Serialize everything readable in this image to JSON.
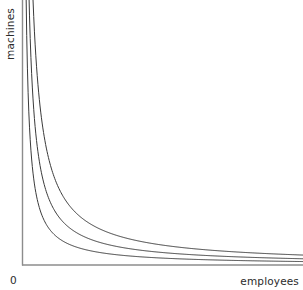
{
  "figure": {
    "kind": "isoquant-diagram",
    "background_color": "#ffffff"
  },
  "axes": {
    "origin_label": "0",
    "y_label": "machines",
    "x_label": "employees",
    "axis_color": "#8c8c8c",
    "label_color": "#2b2b2b"
  },
  "chart_data": {
    "type": "line",
    "title": "",
    "xlabel": "employees",
    "ylabel": "machines",
    "grid": false,
    "legend": null,
    "annotations": [
      "0"
    ],
    "xlim": [
      0,
      10
    ],
    "ylim": [
      0,
      10
    ],
    "curve_color": "#3a3a3a",
    "curve_width": 1,
    "x": [
      0.6,
      0.8,
      1.0,
      1.25,
      1.5,
      1.75,
      2.0,
      2.5,
      3.0,
      3.5,
      4.0,
      5.0,
      6.0,
      7.0,
      8.0,
      9.0,
      10.0
    ],
    "series": [
      {
        "name": "isoquant-1",
        "constant_k": 1.3,
        "values": [
          2.17,
          1.63,
          1.3,
          1.04,
          0.87,
          0.74,
          0.65,
          0.52,
          0.43,
          0.37,
          0.33,
          0.26,
          0.22,
          0.19,
          0.16,
          0.14,
          0.13
        ]
      },
      {
        "name": "isoquant-2",
        "constant_k": 2.35,
        "values": [
          3.92,
          2.94,
          2.35,
          1.88,
          1.57,
          1.34,
          1.18,
          0.94,
          0.78,
          0.67,
          0.59,
          0.47,
          0.39,
          0.34,
          0.29,
          0.26,
          0.24
        ]
      },
      {
        "name": "isoquant-3",
        "constant_k": 3.75,
        "values": [
          6.25,
          4.69,
          3.75,
          3.0,
          2.5,
          2.14,
          1.88,
          1.5,
          1.25,
          1.07,
          0.94,
          0.75,
          0.63,
          0.54,
          0.47,
          0.42,
          0.38
        ]
      }
    ]
  }
}
